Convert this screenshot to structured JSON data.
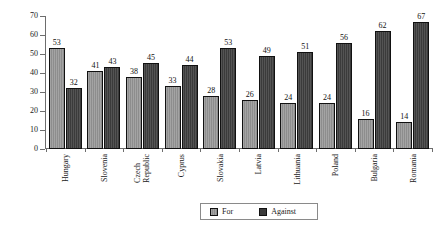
{
  "chart_data": {
    "type": "bar",
    "title": "",
    "subtitle": "",
    "xlabel": "",
    "ylabel": "",
    "ylim": [
      0,
      70
    ],
    "yticks": [
      0,
      10,
      20,
      30,
      40,
      50,
      60,
      70
    ],
    "ytick_labels": [
      "0",
      "10",
      "20",
      "30",
      "40",
      "50",
      "60",
      "70"
    ],
    "grid": false,
    "legend_position": "bottom-center",
    "categories": [
      "Hungary",
      "Slovenia",
      "Czech Republic",
      "Cyprus",
      "Slovakia",
      "Latvia",
      "Lithuania",
      "Poland",
      "Bulgaria",
      "Romania"
    ],
    "category_lines": [
      [
        "Hungary"
      ],
      [
        "Slovenia"
      ],
      [
        "Czech",
        "Republic"
      ],
      [
        "Cyprus"
      ],
      [
        "Slovakia"
      ],
      [
        "Latvia"
      ],
      [
        "Lithuania"
      ],
      [
        "Poland"
      ],
      [
        "Bulgaria"
      ],
      [
        "Romania"
      ]
    ],
    "series": [
      {
        "name": "For",
        "color": "#8d8d8d",
        "values": [
          53,
          41,
          38,
          33,
          28,
          26,
          24,
          24,
          16,
          14
        ]
      },
      {
        "name": "Against",
        "color": "#3b3b3b",
        "values": [
          32,
          43,
          45,
          44,
          53,
          49,
          51,
          56,
          62,
          67
        ]
      }
    ]
  },
  "legend": {
    "items": [
      {
        "label": "For",
        "swatch": "for"
      },
      {
        "label": "Against",
        "swatch": "against"
      }
    ]
  },
  "colors": {
    "for_bar": "#8d8d8d",
    "against_bar": "#3b3b3b",
    "axis": "#6d6d6d",
    "text": "#1a1a1a",
    "background": "#ffffff"
  }
}
